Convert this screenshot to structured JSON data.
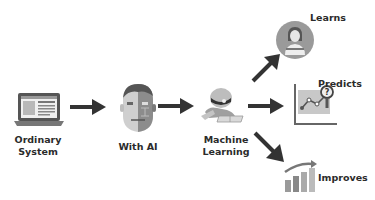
{
  "diagram": {
    "nodes": [
      {
        "id": "ordinary",
        "label_line1": "Ordinary",
        "label_line2": "System",
        "icon": "laptop-icon"
      },
      {
        "id": "with_ai",
        "label": "With AI",
        "icon": "ai-head-icon"
      },
      {
        "id": "ml",
        "label_line1": "Machine",
        "label_line2": "Learning",
        "icon": "robot-reading-icon"
      },
      {
        "id": "learns",
        "label": "Learns",
        "icon": "student-icon"
      },
      {
        "id": "predicts",
        "label": "Predicts",
        "icon": "chart-magnifier-icon"
      },
      {
        "id": "improves",
        "label": "Improves",
        "icon": "growth-bars-icon"
      }
    ],
    "edges": [
      {
        "from": "ordinary",
        "to": "with_ai"
      },
      {
        "from": "with_ai",
        "to": "ml"
      },
      {
        "from": "ml",
        "to": "learns"
      },
      {
        "from": "ml",
        "to": "predicts"
      },
      {
        "from": "ml",
        "to": "improves"
      }
    ],
    "colors": {
      "arrow": "#333333",
      "icon_dark": "#4a4a4a",
      "icon_mid": "#8a8a8a",
      "icon_light": "#c8c8c8"
    }
  }
}
